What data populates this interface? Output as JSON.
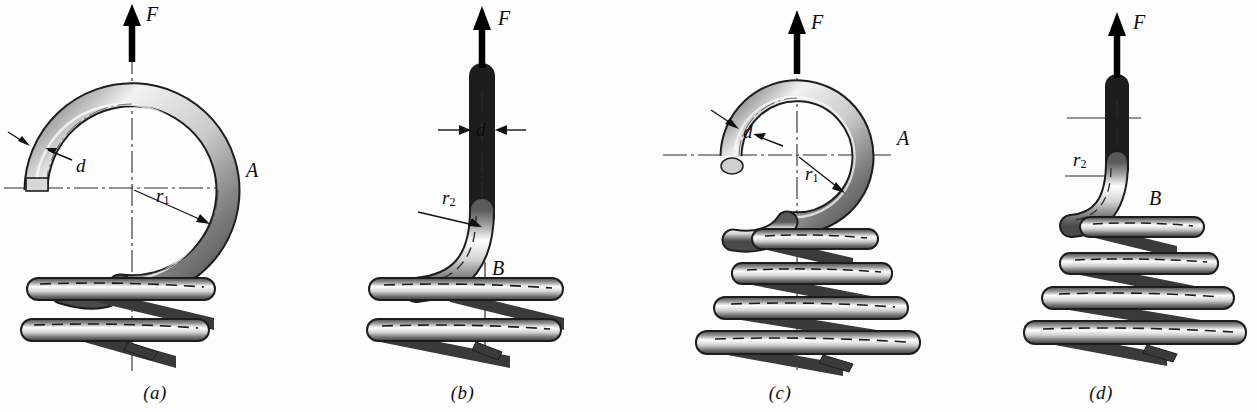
{
  "figure": {
    "background_color": "#fdfdfd",
    "ink_color": "#0c0c0c",
    "metal_light": "#ffffff",
    "metal_mid": "#b8b8b8",
    "metal_dark": "#4a4a4a",
    "shadow_fill": "#3a3a3a"
  },
  "panels": [
    {
      "id": "a",
      "caption": "(a)",
      "view": "front view of full loop hook on cylindrical body",
      "labels": {
        "force": "F",
        "wire_diameter": "d",
        "mean_radius": "r",
        "mean_radius_sub": "1",
        "section": "A"
      },
      "coil_count": 2,
      "body_shape": "cylindrical"
    },
    {
      "id": "b",
      "caption": "(b)",
      "view": "side view of hook bend on cylindrical body",
      "labels": {
        "force": "F",
        "wire_diameter": "d",
        "bend_radius": "r",
        "bend_radius_sub": "2",
        "section": "B"
      },
      "coil_count": 2,
      "body_shape": "cylindrical"
    },
    {
      "id": "c",
      "caption": "(c)",
      "view": "front view of full loop hook on conical body",
      "labels": {
        "force": "F",
        "wire_diameter": "d",
        "mean_radius": "r",
        "mean_radius_sub": "1",
        "section": "A"
      },
      "coil_count": 4,
      "body_shape": "conical"
    },
    {
      "id": "d",
      "caption": "(d)",
      "view": "side view of hook bend on conical body",
      "labels": {
        "force": "F",
        "bend_radius": "r",
        "bend_radius_sub": "2",
        "section": "B"
      },
      "coil_count": 4,
      "body_shape": "conical"
    }
  ]
}
